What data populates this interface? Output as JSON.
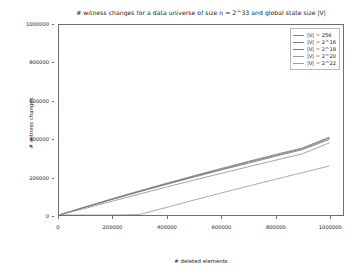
{
  "chart_data": {
    "type": "line",
    "title": "# witness changes for a data universe of size n = 2^33 and global state size |V|",
    "xlabel": "# deleted elements",
    "ylabel": "# witness changes",
    "xlim": [
      0,
      1050000
    ],
    "ylim": [
      0,
      1000000
    ],
    "grid": false,
    "legend_position": "upper right",
    "xticks": [
      0,
      200000,
      400000,
      600000,
      800000,
      1000000
    ],
    "xtick_labels": [
      "0",
      "200000",
      "400000",
      "600000",
      "800000",
      "1000000"
    ],
    "yticks": [
      0,
      200000,
      400000,
      600000,
      800000,
      1000000
    ],
    "ytick_labels": [
      "0",
      "200000",
      "400000",
      "600000",
      "800000",
      "1000000"
    ],
    "x": [
      0,
      100000,
      200000,
      300000,
      400000,
      500000,
      600000,
      700000,
      800000,
      900000,
      1000000
    ],
    "series": [
      {
        "name": "|V| = 256",
        "color": "#808080",
        "values": [
          0,
          44000,
          87000,
          128000,
          168000,
          207000,
          245000,
          282000,
          318000,
          353000,
          410000
        ]
      },
      {
        "name": "|V| = 2^16",
        "color": "#7d7d7d",
        "values": [
          0,
          43000,
          85000,
          126000,
          165000,
          204000,
          241000,
          278000,
          314000,
          349000,
          405000
        ]
      },
      {
        "name": "|V| = 2^18",
        "color": "#7a7a7a",
        "values": [
          0,
          42000,
          83000,
          123000,
          162000,
          200000,
          237000,
          273000,
          309000,
          344000,
          398000
        ]
      },
      {
        "name": "|V| = 2^20",
        "color": "#999999",
        "values": [
          0,
          36000,
          74000,
          111000,
          148000,
          184000,
          219000,
          254000,
          288000,
          322000,
          380000
        ]
      },
      {
        "name": "|V| = 2^22",
        "color": "#a0a0a0",
        "values": [
          0,
          0,
          0,
          3000,
          41000,
          79000,
          116000,
          152000,
          188000,
          223000,
          258000
        ]
      }
    ]
  }
}
